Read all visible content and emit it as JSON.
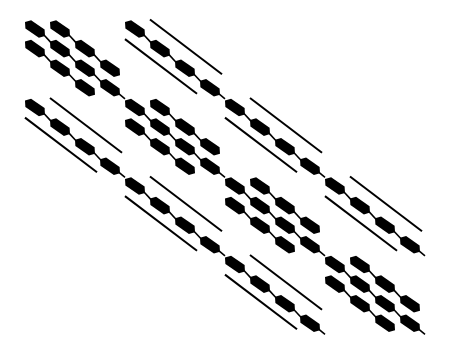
{
  "figure": {
    "title": "",
    "background": "#ffffff",
    "ink": "#000000"
  },
  "layout": {
    "origin_x": 25,
    "origin_y": 19,
    "block_dx": 100,
    "block_dy": 78.5,
    "elem_dx": 25,
    "elem_dy": 19.6,
    "seg_len_x": 20,
    "seg_len_y": 14,
    "seg_thickness": 7
  },
  "blocks": [
    {
      "row": 0,
      "col": 0,
      "type": "diagonal"
    },
    {
      "row": 0,
      "col": 1,
      "type": "offdiagonal"
    },
    {
      "row": 1,
      "col": 0,
      "type": "offdiagonal"
    },
    {
      "row": 1,
      "col": 1,
      "type": "diagonal"
    },
    {
      "row": 1,
      "col": 2,
      "type": "offdiagonal"
    },
    {
      "row": 2,
      "col": 1,
      "type": "offdiagonal"
    },
    {
      "row": 2,
      "col": 2,
      "type": "diagonal"
    },
    {
      "row": 2,
      "col": 3,
      "type": "offdiagonal"
    },
    {
      "row": 3,
      "col": 2,
      "type": "offdiagonal"
    },
    {
      "row": 3,
      "col": 3,
      "type": "diagonal"
    }
  ],
  "block_patterns": {
    "diagonal": {
      "thick_diagonals": [
        0,
        1,
        -1
      ],
      "thin_diagonals": []
    },
    "offdiagonal": {
      "thick_diagonals": [
        0
      ],
      "thin_diagonals": [
        1,
        -1
      ]
    }
  },
  "matrix_size": {
    "blocks": 4,
    "block_size": 4
  }
}
